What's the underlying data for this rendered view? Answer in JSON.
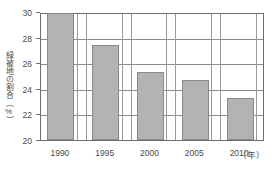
{
  "chart_data": {
    "type": "bar",
    "title": "",
    "subtitle": "",
    "xlabel": "年",
    "ylabel": "緑被地の割合（%）",
    "categories": [
      "1990",
      "1995",
      "2000",
      "2005",
      "2010"
    ],
    "values": [
      29.9,
      27.4,
      25.3,
      24.7,
      23.3
    ],
    "series": [
      {
        "name": "緑被地の割合",
        "values": [
          29.9,
          27.4,
          25.3,
          24.7,
          23.3
        ]
      }
    ],
    "ylim": [
      20,
      30
    ],
    "yticks": [
      20,
      22,
      24,
      26,
      28,
      30
    ],
    "ytick_labels": [
      "20",
      "22",
      "24",
      "26",
      "28",
      "30"
    ],
    "xtick_labels": [
      "1990",
      "1995",
      "2000",
      "2005",
      "2010"
    ],
    "x_unit_label": "（年）",
    "grid": true,
    "grid_horizontal": true,
    "grid_vertical": true,
    "legend": false,
    "legend_position": "none",
    "bar_color": "#b3b3b3",
    "bar_edge_color": "#8a8a8a",
    "axis_color": "#6e6e6e",
    "grid_color": "#8b8b8b",
    "text_color": "#4a4a4a",
    "background_color": "#ffffff"
  },
  "axis": {
    "y_title": "緑被地の割合（%）",
    "x_unit": "（年）"
  }
}
